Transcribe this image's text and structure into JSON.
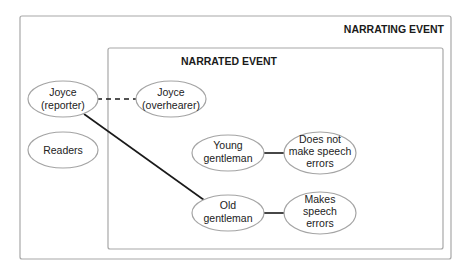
{
  "diagram": {
    "outer_frame": {
      "title": "NARRATING EVENT"
    },
    "inner_frame": {
      "title": "NARRATED EVENT"
    },
    "nodes": {
      "joyce_reporter": {
        "line1": "Joyce",
        "line2": "(reporter)"
      },
      "readers": {
        "line1": "Readers"
      },
      "joyce_overhearer": {
        "line1": "Joyce",
        "line2": "(overhearer)"
      },
      "young_gentleman": {
        "line1": "Young",
        "line2": "gentleman"
      },
      "no_errors": {
        "line1": "Does not",
        "line2": "make speech",
        "line3": "errors"
      },
      "old_gentleman": {
        "line1": "Old",
        "line2": "gentleman"
      },
      "makes_errors": {
        "line1": "Makes",
        "line2": "speech",
        "line3": "errors"
      }
    },
    "edges": [
      {
        "from": "Joyce (reporter)",
        "to": "Joyce (overhearer)",
        "style": "dashed"
      },
      {
        "from": "Joyce (reporter)",
        "to": "Old gentleman",
        "style": "solid"
      },
      {
        "from": "Young gentleman",
        "to": "Does not make speech errors",
        "style": "solid"
      },
      {
        "from": "Old gentleman",
        "to": "Makes speech errors",
        "style": "solid"
      }
    ]
  }
}
